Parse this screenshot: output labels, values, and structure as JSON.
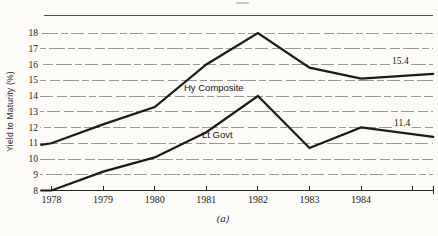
{
  "chart_data": {
    "type": "line",
    "title": "",
    "xlabel": "",
    "ylabel": "Yield to Maturity (%)",
    "caption": "(a)",
    "x_tick_labels": [
      "1978",
      "1979",
      "1980",
      "1981",
      "1982",
      "1983",
      "1984"
    ],
    "x_ticks_years": [
      1978,
      1979,
      1980,
      1981,
      1982,
      1983,
      1984,
      1985
    ],
    "y_tick_labels": [
      "8",
      "9",
      "10",
      "11",
      "12",
      "13",
      "14",
      "15",
      "16",
      "17",
      "18"
    ],
    "ylim": [
      8,
      18
    ],
    "grid": "horizontal-dashed",
    "legend": "inline-labels-on-lines",
    "series": [
      {
        "name": "Hy Composite",
        "x": [
          1977.8,
          1978,
          1979,
          1980,
          1981,
          1982,
          1983,
          1984,
          1985.4
        ],
        "values": [
          10.9,
          11.0,
          12.2,
          13.3,
          16.0,
          18.0,
          15.8,
          15.1,
          15.4
        ],
        "end_label": "15.4"
      },
      {
        "name": "Lt Govt",
        "x": [
          1977.8,
          1978,
          1979,
          1980,
          1981,
          1982,
          1983,
          1984,
          1985.4
        ],
        "values": [
          8.0,
          8.0,
          9.2,
          10.1,
          11.7,
          14.0,
          10.7,
          12.0,
          11.4
        ],
        "end_label": "11.4"
      }
    ],
    "colors": {
      "line": "#1a1a1a",
      "grid": "#8e8e8e",
      "axis": "#242424",
      "top_border": "#4d4d4d",
      "paper": "#fcfbf8",
      "text": "#1f1f1f"
    }
  }
}
